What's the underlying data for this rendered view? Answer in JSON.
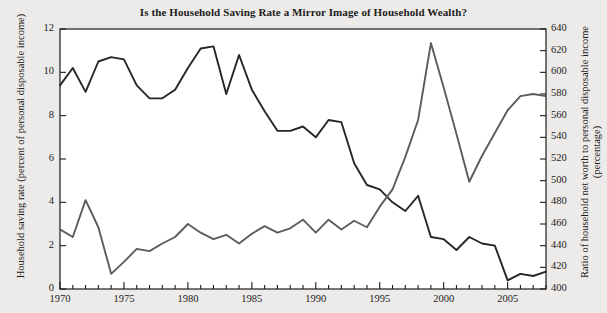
{
  "chart_data": {
    "type": "line",
    "title": "Is the Household Saving Rate a Mirror Image of Household Wealth?",
    "xlabel": "",
    "x": [
      1970,
      1971,
      1972,
      1973,
      1974,
      1975,
      1976,
      1977,
      1978,
      1979,
      1980,
      1981,
      1982,
      1983,
      1984,
      1985,
      1986,
      1987,
      1988,
      1989,
      1990,
      1991,
      1992,
      1993,
      1994,
      1995,
      1996,
      1997,
      1998,
      1999,
      2000,
      2001,
      2002,
      2003,
      2004,
      2005,
      2006,
      2007,
      2008
    ],
    "xlim": [
      1970,
      2008
    ],
    "xticks": [
      1970,
      1975,
      1980,
      1985,
      1990,
      1995,
      2000,
      2005
    ],
    "xticklabels": [
      "1970",
      "1975",
      "1980",
      "1985",
      "1990",
      "1995",
      "2000",
      "2005"
    ],
    "grid": false,
    "legend_position": "inline-annotation",
    "axes": [
      {
        "id": "left",
        "ylabel": "Household saving rate (percent of personal disposable income)",
        "ylim": [
          0,
          12
        ],
        "yticks": [
          0,
          2,
          4,
          6,
          8,
          10,
          12
        ],
        "yticklabels": [
          "0",
          "2",
          "4",
          "6",
          "8",
          "10",
          "12"
        ]
      },
      {
        "id": "right",
        "ylabel": "Ratio of household net worth to personal disposable income (percentage)",
        "ylim": [
          400,
          640
        ],
        "yticks": [
          400,
          420,
          440,
          460,
          480,
          500,
          520,
          540,
          560,
          580,
          600,
          620,
          640
        ],
        "yticklabels": [
          "400",
          "420",
          "440",
          "460",
          "480",
          "500",
          "520",
          "540",
          "560",
          "580",
          "600",
          "620",
          "640"
        ]
      }
    ],
    "series": [
      {
        "name": "Household saving rate",
        "axis": "left",
        "annotation": "Household saving rate\n(left scale)",
        "annotation_line1": "Household saving rate",
        "annotation_line2": "(left scale)",
        "color": "#262626",
        "values": [
          9.4,
          10.2,
          9.1,
          10.5,
          10.7,
          10.6,
          9.4,
          8.8,
          8.8,
          9.2,
          10.2,
          11.1,
          11.2,
          9.0,
          10.8,
          9.2,
          8.2,
          7.3,
          7.3,
          7.5,
          7.0,
          7.8,
          7.7,
          5.8,
          4.8,
          4.6,
          4.0,
          3.6,
          4.3,
          2.4,
          2.3,
          1.8,
          2.4,
          2.1,
          2.0,
          0.4,
          0.7,
          0.6,
          0.8
        ]
      },
      {
        "name": "Household net worth/personal disposable income",
        "axis": "right",
        "annotation": "Household net worth/\npersonal disposable income\n(right scale)",
        "annotation_line1": "Household net worth/",
        "annotation_line2": "personal disposable income",
        "annotation_line3": "(right scale)",
        "color": "#5c5c5c",
        "values": [
          455,
          448,
          482,
          457,
          414,
          425,
          437,
          435,
          442,
          448,
          460,
          452,
          446,
          450,
          442,
          451,
          458,
          452,
          456,
          464,
          452,
          464,
          455,
          463,
          457,
          476,
          492,
          522,
          556,
          627,
          586,
          543,
          499,
          523,
          544,
          565,
          578,
          580,
          578
        ]
      }
    ]
  }
}
